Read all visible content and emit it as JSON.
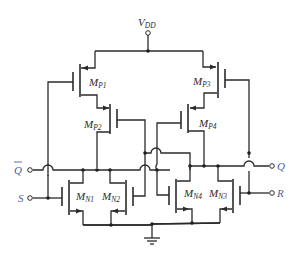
{
  "diagram": {
    "type": "CMOS SR latch (NOR-based) transistor schematic",
    "supply": {
      "label": "V",
      "sub": "DD"
    },
    "transistors": [
      {
        "id": "MP1",
        "label": "M",
        "sub": "P1",
        "kind": "pmos"
      },
      {
        "id": "MP2",
        "label": "M",
        "sub": "P2",
        "kind": "pmos"
      },
      {
        "id": "MP3",
        "label": "M",
        "sub": "P3",
        "kind": "pmos"
      },
      {
        "id": "MP4",
        "label": "M",
        "sub": "P4",
        "kind": "pmos"
      },
      {
        "id": "MN1",
        "label": "M",
        "sub": "N1",
        "kind": "nmos"
      },
      {
        "id": "MN2",
        "label": "M",
        "sub": "N2",
        "kind": "nmos"
      },
      {
        "id": "MN3",
        "label": "M",
        "sub": "N3",
        "kind": "nmos"
      },
      {
        "id": "MN4",
        "label": "M",
        "sub": "N4",
        "kind": "nmos"
      }
    ],
    "terminals": {
      "qbar": {
        "label": "Q",
        "overbar": true
      },
      "s": {
        "label": "S"
      },
      "q": {
        "label": "Q"
      },
      "r": {
        "label": "R"
      }
    },
    "ground": {
      "symbol": "ground"
    },
    "colors": {
      "wire": "#2b2b2b",
      "io_label": "#4a62a0"
    }
  }
}
